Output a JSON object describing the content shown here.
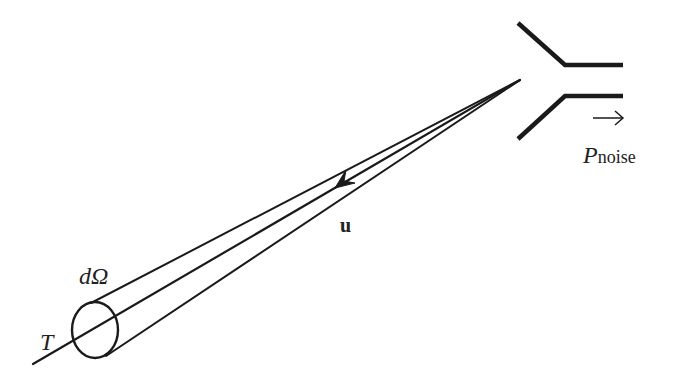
{
  "figure": {
    "type": "antenna noise temperature diagram",
    "colors": {
      "stroke": "#1a1a1a",
      "background": "#ffffff"
    }
  },
  "labels": {
    "solid_angle": "dΩ",
    "temperature": "T",
    "direction_vector": "u",
    "power_symbol": "P",
    "power_subscript": "noise",
    "output_arrow": "→"
  },
  "elements": [
    {
      "name": "source-disk",
      "description": "ellipse representing a sky patch at temperature T"
    },
    {
      "name": "beam-cone",
      "description": "narrow cone from sky patch to antenna subtending dΩ"
    },
    {
      "name": "direction-arrow",
      "description": "arrowhead on central ray pointing toward the sky patch"
    },
    {
      "name": "horn-antenna",
      "description": "horn antenna receiving the radiation"
    },
    {
      "name": "output-arrow",
      "description": "arrow indicating noise power output"
    }
  ]
}
